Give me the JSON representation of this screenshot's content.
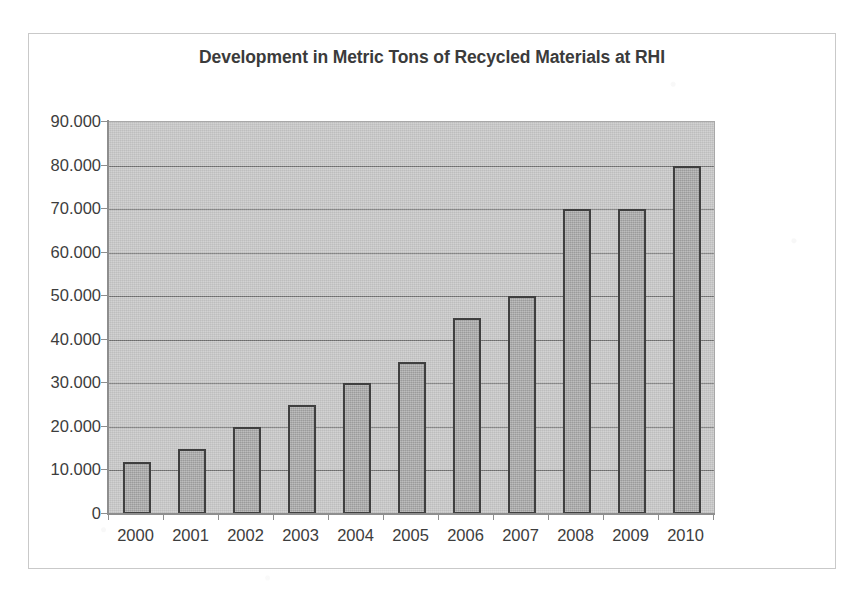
{
  "chart_data": {
    "type": "bar",
    "title": "Development in Metric Tons of Recycled Materials at RHI",
    "xlabel": "",
    "ylabel": "",
    "categories": [
      "2000",
      "2001",
      "2002",
      "2003",
      "2004",
      "2005",
      "2006",
      "2007",
      "2008",
      "2009",
      "2010"
    ],
    "values": [
      12000,
      15000,
      20000,
      25000,
      30000,
      35000,
      45000,
      50000,
      70000,
      70000,
      80000
    ],
    "value_labels": [
      "12.000",
      "15.000",
      "20.000",
      "25.000",
      "30.000",
      "35.000",
      "45.000",
      "50.000",
      "70.000",
      "70.000",
      "80.000"
    ],
    "series": [
      {
        "name": "Recycled Materials",
        "values": [
          12000,
          15000,
          20000,
          25000,
          30000,
          35000,
          45000,
          50000,
          70000,
          70000,
          80000
        ]
      }
    ],
    "ylim": [
      0,
      90000
    ],
    "y_tick_values": [
      0,
      10000,
      20000,
      30000,
      40000,
      50000,
      60000,
      70000,
      80000,
      90000
    ],
    "y_tick_labels": [
      "0",
      "10.000",
      "20.000",
      "30.000",
      "40.000",
      "50.000",
      "60.000",
      "70.000",
      "80.000",
      "90.000"
    ],
    "y_tick_step": 10000,
    "grid": true,
    "grid_axis": "y",
    "legend": false,
    "legend_position": "none",
    "plot_background_color": "#c4c4c4",
    "bar_fill_color": "#a5a5a5",
    "bar_border_color": "#3f3f3f",
    "gridline_color": "#6f6f6f",
    "axis_color": "#8e8e8e",
    "title_color": "#3b3b3b",
    "tick_label_color": "#3d3d3d",
    "frame_border_color": "#c9c9c9",
    "page_background_color": "#ffffff"
  }
}
